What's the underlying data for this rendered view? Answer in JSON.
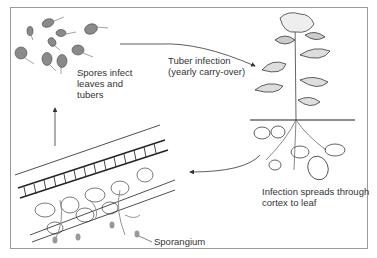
{
  "diagram": {
    "type": "life-cycle",
    "labels": {
      "spores": "Spores infect\nleaves and\ntubers",
      "tuber_infection": "Tuber infection\n(yearly carry-over)",
      "infection_spreads": "Infection spreads through\ncortex to leaf",
      "sporangium": "Sporangium"
    },
    "nodes": [
      {
        "id": "spores",
        "depiction": "zoospores with flagella"
      },
      {
        "id": "plant",
        "depiction": "potato plant with tubers and roots"
      },
      {
        "id": "leaf-section",
        "depiction": "leaf cross-section with hyphae and sporangia"
      }
    ],
    "edges": [
      {
        "from": "spores",
        "to": "plant",
        "label": "Tuber infection (yearly carry-over)"
      },
      {
        "from": "plant",
        "to": "leaf-section",
        "label": "Infection spreads through cortex to leaf"
      },
      {
        "from": "leaf-section",
        "to": "spores",
        "label": ""
      }
    ],
    "colors": {
      "border": "#9a9a9a",
      "spore_fill": "#8a8a8a",
      "line": "#333333",
      "hyphae": "#888888"
    }
  }
}
